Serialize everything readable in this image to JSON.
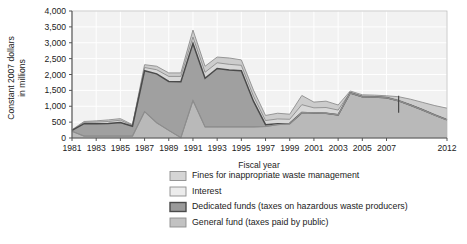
{
  "chart_data": {
    "type": "area",
    "stacked": true,
    "title": "",
    "subtitle": "",
    "xlabel": "Fiscal year",
    "ylabel": "Constant 2007 dollars in millions",
    "ylabel_lines": [
      "Constant 2007 dollars",
      "in millions"
    ],
    "grid": true,
    "legend_position": "bottom",
    "xlim": [
      1981,
      2012
    ],
    "ylim": [
      0,
      4000
    ],
    "ytick_values": [
      0,
      500,
      1000,
      1500,
      2000,
      2500,
      3000,
      3500,
      4000
    ],
    "ytick_labels": [
      "0",
      "500",
      "1,000",
      "1,500",
      "2,000",
      "2,500",
      "3,000",
      "3,500",
      "4,000"
    ],
    "x": [
      1981,
      1982,
      1983,
      1984,
      1985,
      1986,
      1987,
      1988,
      1989,
      1990,
      1991,
      1992,
      1993,
      1994,
      1995,
      1996,
      1997,
      1998,
      1999,
      2000,
      2001,
      2002,
      2003,
      2004,
      2005,
      2006,
      2007,
      2008,
      2009,
      2010,
      2011,
      2012
    ],
    "xtick_values": [
      1981,
      1983,
      1985,
      1987,
      1989,
      1991,
      1993,
      1995,
      1997,
      1999,
      2001,
      2003,
      2005,
      2007,
      2012
    ],
    "xtick_labels": [
      "1981",
      "1983",
      "1985",
      "1987",
      "1989",
      "1991",
      "1993",
      "1995",
      "1997",
      "1999",
      "2001",
      "2003",
      "2005",
      "2007",
      "2012"
    ],
    "series": [
      {
        "name": "General fund (taxes paid by public)",
        "order": 1,
        "color": "#b9b9b9",
        "values": [
          210,
          60,
          60,
          60,
          60,
          60,
          830,
          480,
          240,
          10,
          1180,
          350,
          350,
          350,
          350,
          350,
          360,
          420,
          450,
          800,
          790,
          780,
          730,
          1420,
          1300,
          1290,
          1270,
          1170,
          1030,
          880,
          720,
          570
        ]
      },
      {
        "name": "Dedicated funds (taxes on hazardous waste producers)",
        "order": 2,
        "color": "#a0a0a0",
        "values": [
          30,
          390,
          390,
          400,
          430,
          310,
          1290,
          1540,
          1540,
          1760,
          1800,
          1530,
          1840,
          1790,
          1770,
          810,
          60,
          30,
          10,
          0,
          0,
          0,
          0,
          0,
          0,
          0,
          0,
          0,
          0,
          0,
          0,
          0
        ]
      },
      {
        "name": "Interest",
        "order": 3,
        "color": "#d8d8d8",
        "values": [
          10,
          40,
          50,
          60,
          70,
          30,
          100,
          130,
          160,
          170,
          200,
          190,
          180,
          180,
          170,
          160,
          130,
          150,
          130,
          250,
          160,
          180,
          150,
          20,
          20,
          20,
          20,
          20,
          20,
          20,
          20,
          20
        ]
      },
      {
        "name": "Fines for inappropriate waste management",
        "order": 4,
        "color": "#cccccc",
        "values": [
          10,
          30,
          40,
          50,
          50,
          20,
          90,
          110,
          110,
          110,
          220,
          190,
          180,
          200,
          170,
          190,
          160,
          180,
          160,
          290,
          180,
          200,
          160,
          40,
          40,
          40,
          40,
          110,
          170,
          220,
          280,
          350
        ]
      }
    ],
    "totals": [
      260,
      520,
      540,
      570,
      610,
      420,
      2310,
      2260,
      2050,
      2050,
      3400,
      2260,
      2550,
      2520,
      2460,
      1510,
      710,
      780,
      750,
      1340,
      1130,
      1160,
      1040,
      1480,
      1360,
      1350,
      1330,
      1300,
      1220,
      1120,
      1020,
      940
    ],
    "annotations": [
      {
        "type": "vertical-divider",
        "x": 2008,
        "note": "actual vs projected boundary"
      }
    ]
  },
  "axis": {
    "x_title": "Fiscal year",
    "y_title_line1": "Constant 2007 dollars",
    "y_title_line2": "in millions"
  },
  "legend": {
    "items": [
      {
        "label": "Fines for inappropriate waste management",
        "swatch": "#d5d5d5"
      },
      {
        "label": "Interest",
        "swatch": "#ececec"
      },
      {
        "label": "Dedicated funds (taxes on hazardous waste producers)",
        "swatch": "#9a9a9a"
      },
      {
        "label": "General fund (taxes paid by public)",
        "swatch": "#c2c2c2"
      }
    ]
  },
  "colors": {
    "plot_background": "#f2f2f2",
    "grid": "#ffffff",
    "axis_line": "#555555",
    "outline_dark": "#4a4a4a",
    "text": "#222222"
  }
}
